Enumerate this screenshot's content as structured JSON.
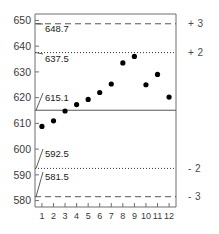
{
  "chart_data": {
    "type": "scatter",
    "title": "",
    "subtitle": "",
    "xlabel": "",
    "ylabel": "",
    "x": [
      1,
      2,
      3,
      4,
      5,
      6,
      7,
      8,
      9,
      10,
      11,
      12
    ],
    "values": [
      608.8,
      611.0,
      614.8,
      617.3,
      619.3,
      622.0,
      625.3,
      633.5,
      636.0,
      625.0,
      629.0,
      620.2
    ],
    "series": [
      {
        "name": "observation",
        "values": [
          608.8,
          611.0,
          614.8,
          617.3,
          619.3,
          622.0,
          625.3,
          633.5,
          636.0,
          625.0,
          629.0,
          620.2
        ]
      }
    ],
    "xlim": [
      0.4,
      12.6
    ],
    "ylim": [
      577.5,
      652.5
    ],
    "x_tick_labels": [
      "1",
      "2",
      "3",
      "4",
      "5",
      "6",
      "7",
      "8",
      "9",
      "10",
      "11",
      "12"
    ],
    "y_tick_labels": [
      "580",
      "590",
      "600",
      "610",
      "620",
      "630",
      "640",
      "650"
    ],
    "y_ticks": [
      580,
      590,
      600,
      610,
      620,
      630,
      640,
      650
    ],
    "grid": false,
    "legend": "none",
    "control_limits": [
      {
        "name": "plus-3-sigma",
        "value": 648.7,
        "label": "648.7",
        "sigma_label": "+ 3",
        "style": "dashed"
      },
      {
        "name": "plus-2-sigma",
        "value": 637.5,
        "label": "637.5",
        "sigma_label": "+ 2",
        "style": "dotted"
      },
      {
        "name": "center-line",
        "value": 615.1,
        "label": "615.1",
        "sigma_label": "",
        "style": "solid"
      },
      {
        "name": "minus-2-sigma",
        "value": 592.5,
        "label": "592.5",
        "sigma_label": "- 2",
        "style": "dotted"
      },
      {
        "name": "minus-3-sigma",
        "value": 581.5,
        "label": "581.5",
        "sigma_label": "- 3",
        "style": "dashed"
      }
    ],
    "annotations": [
      "648.7",
      "637.5",
      "615.1",
      "592.5",
      "581.5"
    ],
    "colors": {
      "point": "#000000",
      "center_line": "#555555",
      "sigma2_line": "#333333",
      "sigma3_line": "#555555",
      "frame": "#6f6f6f",
      "text": "#1a1a1a",
      "background": "#ffffff"
    }
  }
}
